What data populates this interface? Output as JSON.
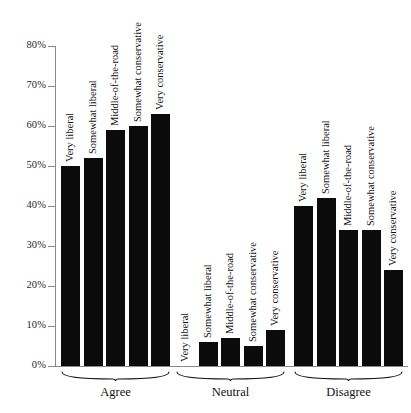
{
  "chart_data": {
    "type": "bar",
    "title": "",
    "subtitle": "",
    "xlabel": "",
    "ylabel": "",
    "ylim": [
      0,
      80
    ],
    "ytick_labels": [
      "0%",
      "10%",
      "20%",
      "30%",
      "40%",
      "50%",
      "60%",
      "70%",
      "80%"
    ],
    "ytick_values": [
      0,
      10,
      20,
      30,
      40,
      50,
      60,
      70,
      80
    ],
    "grid": false,
    "legend": "none",
    "bar_color": "#0b0b0b",
    "axis_color": "#8a8a8a",
    "categories": [
      "Very liberal",
      "Somewhat liberal",
      "Middle-of-the-road",
      "Somewhat conservative",
      "Very conservative"
    ],
    "groups": [
      {
        "name": "Agree",
        "bars": [
          {
            "label": "Very liberal",
            "value": 50
          },
          {
            "label": "Somewhat liberal",
            "value": 52
          },
          {
            "label": "Middle-of-the-road",
            "value": 59
          },
          {
            "label": "Somewhat conservative",
            "value": 60
          },
          {
            "label": "Very conservative",
            "value": 63
          }
        ]
      },
      {
        "name": "Neutral",
        "bars": [
          {
            "label": "Very liberal",
            "value": 0
          },
          {
            "label": "Somewhat liberal",
            "value": 6
          },
          {
            "label": "Middle-of-the-road",
            "value": 7
          },
          {
            "label": "Somewhat conservative",
            "value": 5
          },
          {
            "label": "Very conservative",
            "value": 9
          }
        ]
      },
      {
        "name": "Disagree",
        "bars": [
          {
            "label": "Very liberal",
            "value": 40
          },
          {
            "label": "Somewhat liberal",
            "value": 42
          },
          {
            "label": "Middle-of-the-road",
            "value": 34
          },
          {
            "label": "Somewhat conservative",
            "value": 34
          },
          {
            "label": "Very conservative",
            "value": 24
          }
        ]
      }
    ]
  }
}
